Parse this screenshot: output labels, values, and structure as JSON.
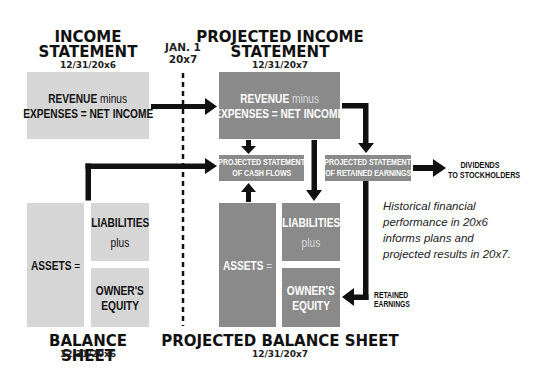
{
  "timeline": {
    "divider_label_line1": "JAN. 1",
    "divider_label_line2": "20x7"
  },
  "income_statement": {
    "title_line1": "INCOME",
    "title_line2": "STATEMENT",
    "date": "12/31/20x6",
    "formula_bold1": "REVENUE",
    "formula_thin": " minus",
    "formula_line2": "EXPENSES = NET INCOME"
  },
  "projected_income_statement": {
    "title_line1": "PROJECTED INCOME",
    "title_line2": "STATEMENT",
    "date": "12/31/20x7",
    "formula_bold1": "REVENUE",
    "formula_thin": " minus",
    "formula_line2": "EXPENSES = NET INCOME"
  },
  "cash_flows": {
    "line1": "PROJECTED STATEMENT",
    "line2": "OF CASH FLOWS"
  },
  "retained_earnings_statement": {
    "line1": "PROJECTED STATEMENT",
    "line2": "OF RETAINED EARNINGS"
  },
  "dividends": {
    "line1": "DIVIDENDS",
    "line2": "TO STOCKHOLDERS"
  },
  "retained_earnings_label": {
    "line1": "RETAINED",
    "line2": "EARNINGS"
  },
  "balance_sheet": {
    "title": "BALANCE SHEET",
    "date": "12/31/20x6",
    "assets": "ASSETS",
    "assets_suffix": " =",
    "liabilities": "LIABILITIES",
    "plus": "plus",
    "equity_line1": "OWNER'S",
    "equity_line2": "EQUITY"
  },
  "projected_balance_sheet": {
    "title": "PROJECTED BALANCE SHEET",
    "date": "12/31/20x7",
    "assets": "ASSETS",
    "assets_suffix": " =",
    "liabilities": "LIABILITIES",
    "plus": "plus",
    "equity_line1": "OWNER'S",
    "equity_line2": "EQUITY"
  },
  "note": {
    "line1": "Historical financial",
    "line2": "performance in 20x6",
    "line3": "informs plans and",
    "line4": "projected results in 20x7."
  },
  "colors": {
    "historical_fill": "#d6d6d6",
    "projected_fill": "#8a8a8a",
    "arrow": "#111111"
  }
}
